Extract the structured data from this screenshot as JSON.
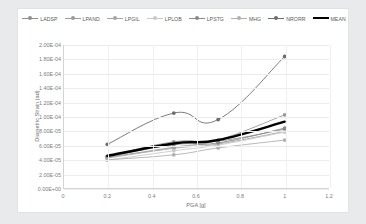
{
  "chart_data": {
    "type": "line",
    "title": "",
    "xlabel": "PGA [g]",
    "ylabel": "Diametric Strain (ad)",
    "x": [
      0.2,
      0.5,
      0.7,
      1.0
    ],
    "xlim": [
      0,
      1.2
    ],
    "ylim": [
      0.0,
      0.0002
    ],
    "xticks": [
      "0",
      "0.2",
      "0.4",
      "0.6",
      "0.8",
      "1",
      "1.2"
    ],
    "xtick_values": [
      0,
      0.2,
      0.4,
      0.6,
      0.8,
      1.0,
      1.2
    ],
    "yticks": [
      "0.00E+00",
      "2.00E-05",
      "4.00E-05",
      "6.00E-05",
      "8.00E-05",
      "1.00E-04",
      "1.20E-04",
      "1.40E-04",
      "1.60E-04",
      "1.80E-04",
      "2.00E-04"
    ],
    "ytick_values": [
      0,
      2e-05,
      4e-05,
      6e-05,
      8e-05,
      0.0001,
      0.00012,
      0.00014,
      0.00016,
      0.00018,
      0.0002
    ],
    "grid": true,
    "grid_axis": "both",
    "legend_position": "top",
    "series": [
      {
        "name": "LADSP",
        "values": [
          4.55e-05,
          6.55e-05,
          6.65e-05,
          8.3e-05
        ],
        "color": "#8f8f8f",
        "width": 0.9,
        "marker": true
      },
      {
        "name": "LPAND",
        "values": [
          4.4e-05,
          5.8e-05,
          6.8e-05,
          0.000103
        ],
        "color": "#9a9a9a",
        "width": 0.9,
        "marker": true
      },
      {
        "name": "LPGIL",
        "values": [
          4.3e-05,
          5.65e-05,
          6.25e-05,
          8e-05
        ],
        "color": "#a5a5a5",
        "width": 0.9,
        "marker": true
      },
      {
        "name": "LPLOB",
        "values": [
          4e-05,
          5.3e-05,
          6.1e-05,
          7.9e-05
        ],
        "color": "#c9c9c9",
        "width": 0.9,
        "marker": true
      },
      {
        "name": "LPSTG",
        "values": [
          4.45e-05,
          6.15e-05,
          6.4e-05,
          8.45e-05
        ],
        "color": "#8a8a8a",
        "width": 0.9,
        "marker": true
      },
      {
        "name": "MHG",
        "values": [
          4.05e-05,
          4.75e-05,
          5.7e-05,
          6.8e-05
        ],
        "color": "#b0b0b0",
        "width": 0.9,
        "marker": true
      },
      {
        "name": "NRORR",
        "values": [
          6.2e-05,
          0.0001055,
          9.65e-05,
          0.000184
        ],
        "color": "#6d6d6d",
        "width": 0.9,
        "marker": true
      },
      {
        "name": "MEAN",
        "values": [
          4.6e-05,
          6.32e-05,
          6.8e-05,
          9.35e-05
        ],
        "color": "#000000",
        "width": 2.4,
        "marker": false
      }
    ]
  },
  "legend": {
    "items": [
      {
        "label": "LADSP",
        "color": "#8f8f8f",
        "thick": false,
        "marker": true
      },
      {
        "label": "LPAND",
        "color": "#9a9a9a",
        "thick": false,
        "marker": true
      },
      {
        "label": "LPGIL",
        "color": "#a5a5a5",
        "thick": false,
        "marker": true
      },
      {
        "label": "LPLOB",
        "color": "#c9c9c9",
        "thick": false,
        "marker": true
      },
      {
        "label": "LPSTG",
        "color": "#8a8a8a",
        "thick": false,
        "marker": true
      },
      {
        "label": "MHG",
        "color": "#b0b0b0",
        "thick": false,
        "marker": true
      },
      {
        "label": "NRORR",
        "color": "#6d6d6d",
        "thick": false,
        "marker": true
      },
      {
        "label": "MEAN",
        "color": "#000000",
        "thick": true,
        "marker": false
      }
    ]
  },
  "colors": {
    "page_background": "#e9eaec",
    "card_background": "#ffffff",
    "grid": "#ececec",
    "axis": "#d4d4d4",
    "tick_text": "#7c7c7c",
    "label_text": "#6e6e6e",
    "mean_line": "#000000"
  }
}
